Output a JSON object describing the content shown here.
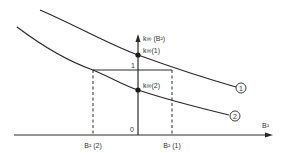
{
  "diagram": {
    "axes": {
      "y_label": "k∞ (B²)",
      "x_label": "B²",
      "origin_label": "0",
      "y_tick_label": "1"
    },
    "points": {
      "k1_label": "k∞(1)",
      "k2_label": "k∞(2)"
    },
    "x_markers": {
      "b2_2": "B² (2)",
      "b2_1": "B² (1)"
    },
    "curves": [
      {
        "id": "1",
        "label": "1"
      },
      {
        "id": "2",
        "label": "2"
      }
    ],
    "colors": {
      "line": "#2a2a2a",
      "background": "#ffffff"
    }
  }
}
